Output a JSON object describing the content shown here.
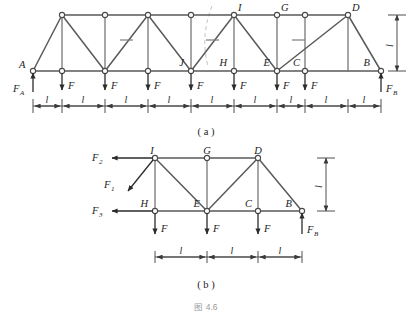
{
  "document": {
    "figure_caption": "图 4.6",
    "subfigure_a_caption": "( a )",
    "subfigure_b_caption": "( b )"
  },
  "colors": {
    "member": "#5a5a5a",
    "node_fill": "#ffffff",
    "node_stroke": "#4a4a4a",
    "force": "#2b2b2b",
    "dimension": "#3a3a3a",
    "cut_line": "#c9c9c9",
    "caption_gray": "#9a9a9a",
    "text": "#1c1c1c"
  },
  "figure_a": {
    "name": "full-pratt-truss",
    "description": "Nine-panel truss with sloped end posts, pin support at A and roller at B",
    "panel_count": 8,
    "joint_labels": {
      "A": "A",
      "B": "B",
      "C": "C",
      "D": "D",
      "E": "E",
      "G": "G",
      "H": "H",
      "I": "I",
      "J": "J"
    },
    "reaction_labels": {
      "left": "F",
      "left_sub": "A",
      "right": "F",
      "right_sub": "B"
    },
    "load_label": "F",
    "load_count": 7,
    "span_label": "l",
    "span_count": 8,
    "height_label": "l"
  },
  "figure_b": {
    "name": "free-body-right-section",
    "description": "Free body diagram of the right cut portion of the truss",
    "joint_labels": {
      "B": "B",
      "C": "C",
      "D": "D",
      "E": "E",
      "G": "G",
      "H": "H",
      "I": "I"
    },
    "internal_forces": [
      {
        "label": "F",
        "sub": "2",
        "at": "I",
        "direction": "left-horizontal"
      },
      {
        "label": "F",
        "sub": "1",
        "at": "I",
        "direction": "down-left-diagonal"
      },
      {
        "label": "F",
        "sub": "3",
        "at": "H",
        "direction": "left-horizontal"
      }
    ],
    "reaction_labels": {
      "right": "F",
      "right_sub": "B"
    },
    "load_label": "F",
    "load_count": 3,
    "span_label": "l",
    "span_count": 3,
    "height_label": "l"
  }
}
